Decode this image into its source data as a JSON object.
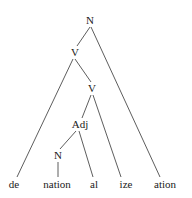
{
  "diagram": {
    "type": "morphological-tree",
    "nodes": {
      "root": {
        "label": "N",
        "x": 90,
        "y": 20
      },
      "v1": {
        "label": "V",
        "x": 75,
        "y": 52
      },
      "v2": {
        "label": "V",
        "x": 92,
        "y": 88
      },
      "adj": {
        "label": "Adj",
        "x": 80,
        "y": 124
      },
      "n2": {
        "label": "N",
        "x": 58,
        "y": 155
      }
    },
    "leaves": {
      "de": {
        "label": "de",
        "x": 14,
        "y": 184
      },
      "nation": {
        "label": "nation",
        "x": 57,
        "y": 184
      },
      "al": {
        "label": "al",
        "x": 94,
        "y": 184
      },
      "ize": {
        "label": "ize",
        "x": 126,
        "y": 184
      },
      "ation": {
        "label": "ation",
        "x": 165,
        "y": 184
      }
    },
    "edges": [
      [
        "root",
        "v1"
      ],
      [
        "root",
        "ation"
      ],
      [
        "v1",
        "de"
      ],
      [
        "v1",
        "v2"
      ],
      [
        "v2",
        "adj"
      ],
      [
        "v2",
        "ize"
      ],
      [
        "adj",
        "n2"
      ],
      [
        "adj",
        "al"
      ],
      [
        "n2",
        "nation"
      ]
    ],
    "line_color": "#333333"
  }
}
